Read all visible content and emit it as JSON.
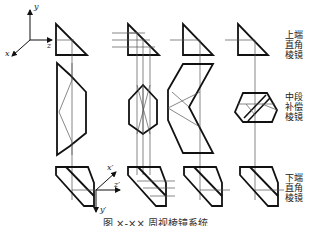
{
  "figure": {
    "caption": "图 ×-×× 周视棱镜系统",
    "labels": {
      "top": "上端直角棱镜",
      "top_line1": "上端",
      "top_line2": "直角",
      "top_line3": "棱镜",
      "middle_line1": "中段",
      "middle_line2": "补偿",
      "middle_line3": "棱镜",
      "bottom_line1": "下端",
      "bottom_line2": "直角",
      "bottom_line3": "棱镜"
    },
    "axes_top": {
      "x": "x",
      "y": "y",
      "z": "z"
    },
    "axes_bottom": {
      "x": "x′",
      "y": "y′",
      "z": "z′"
    },
    "columns": [
      {
        "id": "col-1",
        "middle_prism": "trapezoid-dove-prism"
      },
      {
        "id": "col-2",
        "middle_prism": "hexagonal-prism"
      },
      {
        "id": "col-3",
        "middle_prism": "roof-prism"
      },
      {
        "id": "col-4",
        "middle_prism": "split-compensating-prism"
      }
    ],
    "colors": {
      "stroke": "#111111",
      "ray": "#555555",
      "text": "#222222",
      "background": "#ffffff"
    }
  }
}
